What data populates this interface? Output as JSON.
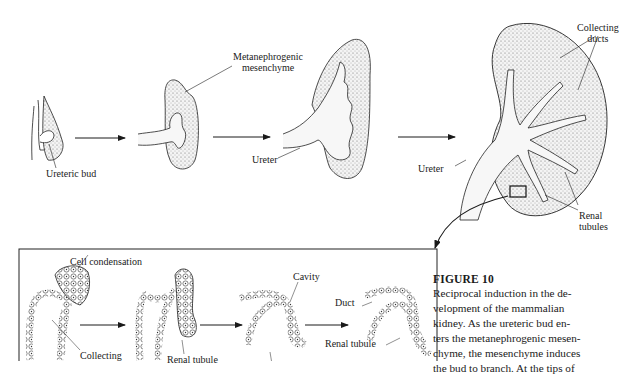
{
  "figure": {
    "top_row_labels": {
      "ureteric_bud": "Ureteric bud",
      "metanephrogenic_line1": "Metanephrogenic",
      "metanephrogenic_line2": "mesenchyme",
      "ureter_stage3": "Ureter",
      "ureter_stage4": "Ureter",
      "collecting_line1": "Collecting",
      "collecting_line2": "ducts",
      "renal_line1": "Renal",
      "renal_line2": "tubules"
    },
    "inset_labels": {
      "cell_condensation": "Cell condensation",
      "collecting": "Collecting",
      "renal_tubule_1": "Renal tubule",
      "cavity": "Cavity",
      "duct": "Duct",
      "renal_tubule_2": "Renal tubule"
    }
  },
  "caption": {
    "title": "FIGURE 10",
    "lines": [
      "Reciprocal induction in the de-",
      "velopment of the mammalian",
      "kidney. As the ureteric bud en-",
      "ters the metanephrogenic mesen-",
      "chyme, the mesenchyme induces",
      "the bud to branch. At the tips of"
    ]
  }
}
